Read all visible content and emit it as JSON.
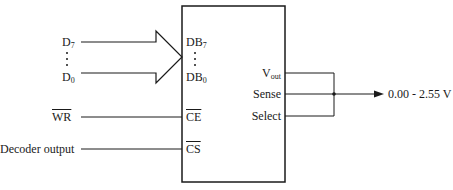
{
  "diagram": {
    "type": "DAC interface block diagram",
    "inputs": {
      "data_bus_top": "D",
      "data_bus_top_sub": "7",
      "data_bus_bottom": "D",
      "data_bus_bottom_sub": "0",
      "write": "WR",
      "decoder": "Decoder output"
    },
    "chip_pins_left": {
      "db_top": "DB",
      "db_top_sub": "7",
      "db_bottom": "DB",
      "db_bottom_sub": "0",
      "ce": "CE",
      "cs": "CS"
    },
    "chip_pins_right": {
      "vout": "V",
      "vout_sub": "out",
      "sense": "Sense",
      "select": "Select"
    },
    "output": {
      "range": "0.00 - 2.55 V"
    },
    "colors": {
      "line": "#1a1a1a",
      "background": "#ffffff"
    }
  }
}
